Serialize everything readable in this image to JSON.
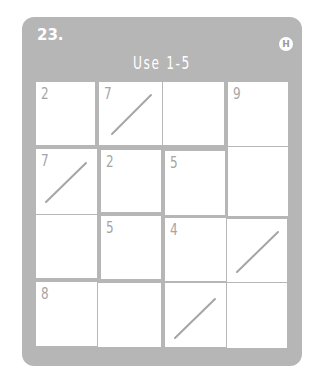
{
  "puzzle": {
    "number": "23.",
    "difficulty_badge": "H",
    "instruction": "Use 1-5",
    "colors": {
      "card": "#b6b6b6",
      "cell": "#ffffff",
      "clue_text": "#a5a5a5",
      "header_text": "#ffffff"
    },
    "grid_size": {
      "rows": 4,
      "cols": 4
    },
    "cells": [
      {
        "row": 1,
        "col": 1,
        "clue": "2",
        "slash": false
      },
      {
        "row": 1,
        "col": 2,
        "clue": "7",
        "slash": true
      },
      {
        "row": 1,
        "col": 3,
        "clue": "",
        "slash": false
      },
      {
        "row": 1,
        "col": 4,
        "clue": "9",
        "slash": false
      },
      {
        "row": 2,
        "col": 1,
        "clue": "7",
        "slash": true
      },
      {
        "row": 2,
        "col": 2,
        "clue": "2",
        "slash": false
      },
      {
        "row": 2,
        "col": 3,
        "clue": "5",
        "slash": false
      },
      {
        "row": 2,
        "col": 4,
        "clue": "",
        "slash": false
      },
      {
        "row": 3,
        "col": 1,
        "clue": "",
        "slash": false
      },
      {
        "row": 3,
        "col": 2,
        "clue": "5",
        "slash": false
      },
      {
        "row": 3,
        "col": 3,
        "clue": "4",
        "slash": false
      },
      {
        "row": 3,
        "col": 4,
        "clue": "",
        "slash": true
      },
      {
        "row": 4,
        "col": 1,
        "clue": "8",
        "slash": false
      },
      {
        "row": 4,
        "col": 2,
        "clue": "",
        "slash": false
      },
      {
        "row": 4,
        "col": 3,
        "clue": "",
        "slash": true
      },
      {
        "row": 4,
        "col": 4,
        "clue": "",
        "slash": false
      }
    ]
  }
}
